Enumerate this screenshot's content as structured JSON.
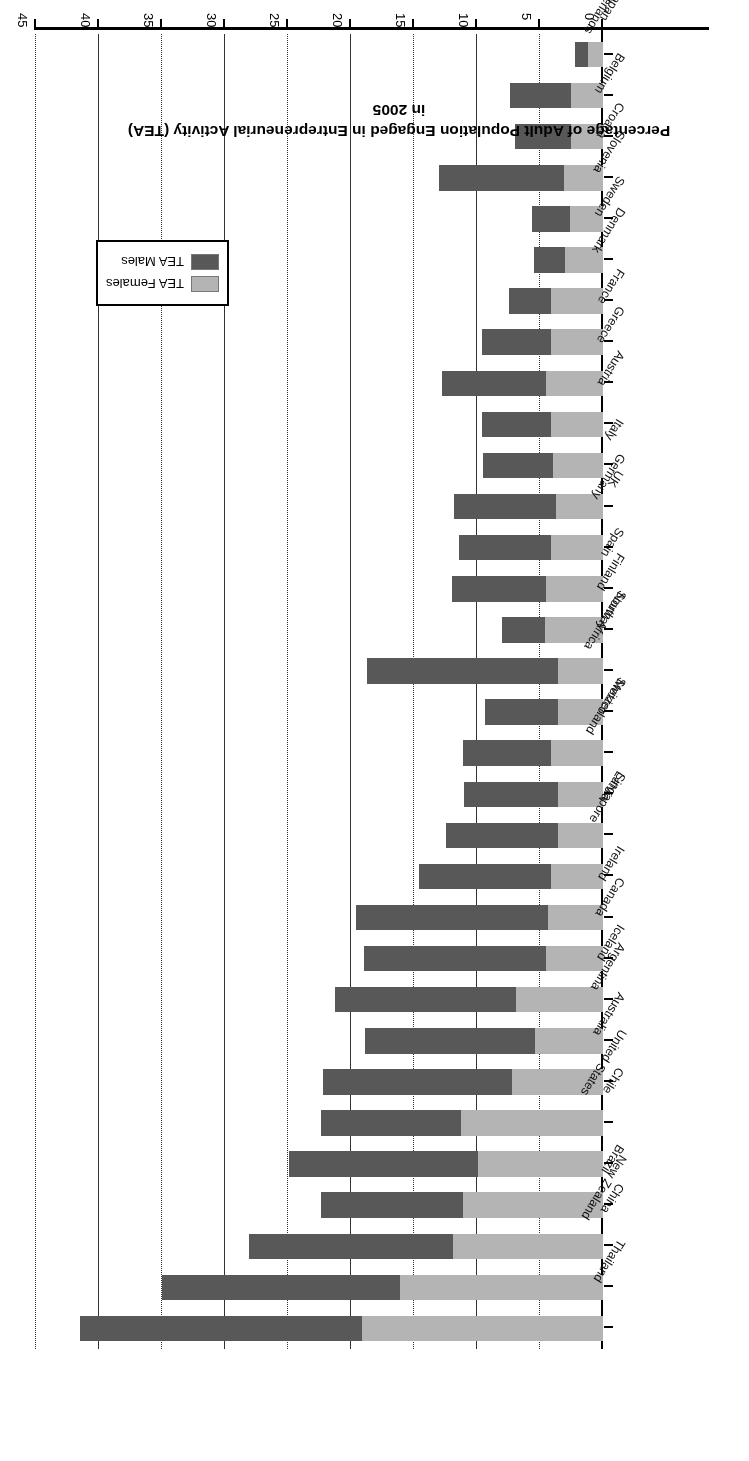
{
  "chart_data": {
    "type": "bar",
    "orientation": "horizontal",
    "stacked": true,
    "title": "",
    "xlabel": "",
    "ylabel": "Percentage of Adult Population Engaged in Entrepreneurial Activity (TEA) in 2005",
    "ylim": [
      0,
      45
    ],
    "ticks": [
      0,
      5,
      10,
      15,
      20,
      25,
      30,
      35,
      40,
      45
    ],
    "grid": true,
    "legend_position": "upper-right",
    "categories": [
      "Thailand",
      "New Zealand",
      "China",
      "Brazil",
      "United States",
      "Chile",
      "Australia",
      "Argentina",
      "Iceland",
      "Canada",
      "Ireland",
      "Singapore",
      "Latvia",
      "Switzerland",
      "Mexico",
      "South Africa",
      "Norway",
      "Finland",
      "Spain",
      "Germany",
      "UK",
      "Italy",
      "Austria",
      "Greece",
      "France",
      "Denmark",
      "Sweden",
      "Slovenia",
      "Croatia",
      "Belgium",
      "Netherlands",
      "Japan"
    ],
    "series": [
      {
        "name": "TEA Females",
        "color": "#b4b4b4",
        "values": [
          19.1,
          16.1,
          11.9,
          11.1,
          9.9,
          11.3,
          7.2,
          5.4,
          6.9,
          4.5,
          4.4,
          4.1,
          3.6,
          3.6,
          4.1,
          3.6,
          3.6,
          4.6,
          4.5,
          4.1,
          3.7,
          4.0,
          4.1,
          4.5,
          4.1,
          4.1,
          3.0,
          2.6,
          3.1,
          2.5,
          2.5,
          1.2
        ]
      },
      {
        "name": "TEA Males",
        "color": "#585858",
        "values": [
          22.4,
          18.9,
          16.2,
          11.3,
          15.0,
          11.1,
          15.0,
          13.5,
          14.4,
          14.5,
          15.2,
          10.5,
          8.9,
          7.4,
          7.0,
          5.8,
          15.1,
          3.4,
          7.5,
          7.3,
          8.1,
          5.5,
          5.5,
          8.3,
          5.5,
          3.4,
          2.5,
          3.0,
          9.9,
          4.5,
          4.9,
          1.0
        ]
      }
    ],
    "totals": [
      41.5,
      35.0,
      28.1,
      22.4,
      24.9,
      22.4,
      22.2,
      18.9,
      21.3,
      19.0,
      19.6,
      14.6,
      12.5,
      11.0,
      11.1,
      9.4,
      18.7,
      8.0,
      12.0,
      11.4,
      11.8,
      9.5,
      9.6,
      12.8,
      9.6,
      7.5,
      5.5,
      5.6,
      13.0,
      7.0,
      7.4,
      2.2
    ]
  },
  "legend": {
    "items": [
      {
        "label": "TEA Females"
      },
      {
        "label": "TEA Males"
      }
    ]
  }
}
